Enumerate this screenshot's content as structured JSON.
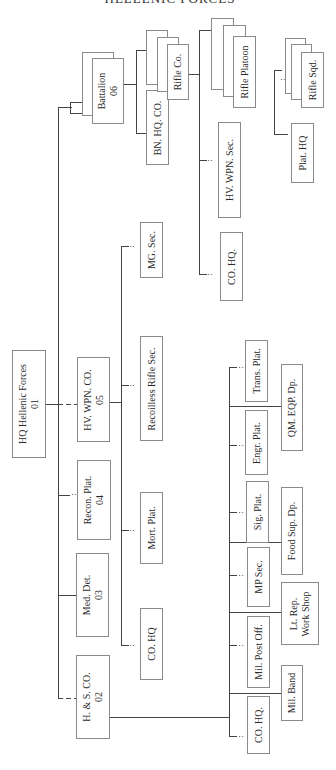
{
  "title": "HELLENIC FORCES",
  "units": {
    "hq": {
      "name": "HQ Hellenic Forces",
      "code": "01"
    },
    "hs_co": {
      "name": "H. & S. CO.",
      "code": "02"
    },
    "med_det": {
      "name": "Med. Det.",
      "code": "03"
    },
    "recon_plat": {
      "name": "Recon. Plat.",
      "code": "04"
    },
    "hv_wpn_co": {
      "name": "HV. WPN. CO.",
      "code": "05"
    },
    "battalion": {
      "name": "Battalion",
      "code": "06"
    }
  },
  "hv_wpn_co_children": {
    "co_hq": "CO. HQ",
    "mort_plat": "Mort. Plat.",
    "recoilless": "Recoilless Rifle Sec.",
    "mg_sec": "MG. Sec."
  },
  "battalion_children": {
    "bn_hq_co": "BN. HQ. CO.",
    "rifle_co": "Rifle Co."
  },
  "rifle_co_children": {
    "co_hq": "CO. HQ.",
    "hv_wpn_sec": "HV. WPN. Sec.",
    "rifle_platoon": "Rifle Platoon"
  },
  "rifle_platoon_children": {
    "plat_hq": "Plat. HQ",
    "rifle_sqd": "Rifle Sqd."
  },
  "hs_co_children": {
    "co_hq": "CO. HQ.",
    "mil_post_off": "Mil. Post Off.",
    "mp_sec": "MP Sec.",
    "sig_plat": "Sig. Plat.",
    "engr_plat": "Engr. Plat.",
    "trans_plat": "Trans. Plat.",
    "mil_band": "Mil. Band",
    "lt_rep": "Lt. Rep.",
    "work_shop": "Work Shop",
    "food_sup": "Food Sup. Dp.",
    "qm_eqp": "QM. EQP. Dp."
  },
  "dots": ":"
}
